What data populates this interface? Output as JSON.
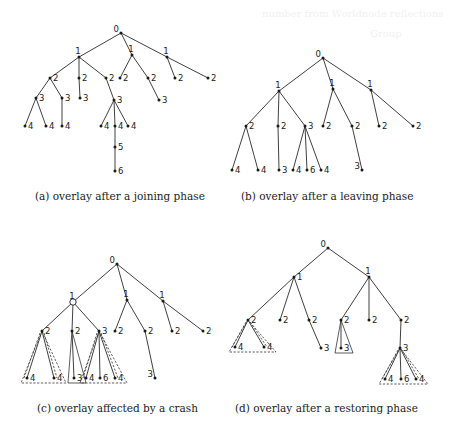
{
  "figure": {
    "ghost_text": [
      "number from Worldnode  reflections",
      "Group"
    ],
    "panels": [
      {
        "id": "a",
        "caption": "(a) overlay after a joining phase",
        "nodes": [
          {
            "id": "r",
            "label": "0",
            "lp": "left"
          },
          {
            "id": "a1",
            "label": "1",
            "lp": "above"
          },
          {
            "id": "a2",
            "label": "1",
            "lp": "above"
          },
          {
            "id": "a3",
            "label": "1",
            "lp": "above"
          },
          {
            "id": "b1",
            "label": "2"
          },
          {
            "id": "b2",
            "label": "2"
          },
          {
            "id": "b3",
            "label": "2"
          },
          {
            "id": "b4",
            "label": "2"
          },
          {
            "id": "b5",
            "label": "2"
          },
          {
            "id": "b6",
            "label": "2"
          },
          {
            "id": "b7",
            "label": "2"
          },
          {
            "id": "c1",
            "label": "3"
          },
          {
            "id": "c2",
            "label": "3"
          },
          {
            "id": "c3",
            "label": "3"
          },
          {
            "id": "c4",
            "label": "3"
          },
          {
            "id": "c5",
            "label": "3"
          },
          {
            "id": "d1",
            "label": "4"
          },
          {
            "id": "d2",
            "label": "4"
          },
          {
            "id": "d3",
            "label": "4"
          },
          {
            "id": "d4",
            "label": "4"
          },
          {
            "id": "d5",
            "label": "4"
          },
          {
            "id": "d6",
            "label": "4"
          },
          {
            "id": "e1",
            "label": "5"
          },
          {
            "id": "f1",
            "label": "6"
          }
        ],
        "edges": [
          [
            "r",
            "a1"
          ],
          [
            "r",
            "a2"
          ],
          [
            "r",
            "a3"
          ],
          [
            "a1",
            "b1"
          ],
          [
            "a1",
            "b2"
          ],
          [
            "a1",
            "b3"
          ],
          [
            "a2",
            "b4"
          ],
          [
            "a2",
            "b5"
          ],
          [
            "a3",
            "b6"
          ],
          [
            "a3",
            "b7"
          ],
          [
            "b1",
            "c1"
          ],
          [
            "b1",
            "c2"
          ],
          [
            "b2",
            "c3"
          ],
          [
            "b3",
            "c4"
          ],
          [
            "b5",
            "c5"
          ],
          [
            "c1",
            "d1"
          ],
          [
            "c1",
            "d2"
          ],
          [
            "c2",
            "d3"
          ],
          [
            "c4",
            "d4"
          ],
          [
            "c4",
            "d5"
          ],
          [
            "c4",
            "d6"
          ],
          [
            "d5",
            "e1"
          ],
          [
            "e1",
            "f1"
          ]
        ],
        "triangles": []
      },
      {
        "id": "b",
        "caption": "(b) overlay after a leaving phase",
        "nodes": [
          {
            "id": "r",
            "label": "0",
            "lp": "left"
          },
          {
            "id": "a1",
            "label": "1",
            "lp": "above"
          },
          {
            "id": "a2",
            "label": "1",
            "lp": "above"
          },
          {
            "id": "a3",
            "label": "1",
            "lp": "above"
          },
          {
            "id": "b1",
            "label": "2"
          },
          {
            "id": "b2",
            "label": "2"
          },
          {
            "id": "b3",
            "label": "3"
          },
          {
            "id": "b4",
            "label": "2"
          },
          {
            "id": "b5",
            "label": "2"
          },
          {
            "id": "b6",
            "label": "2"
          },
          {
            "id": "b7",
            "label": "2"
          },
          {
            "id": "c1",
            "label": "4"
          },
          {
            "id": "c2",
            "label": "4"
          },
          {
            "id": "c3",
            "label": "3"
          },
          {
            "id": "c4",
            "label": "4"
          },
          {
            "id": "c5",
            "label": "6"
          },
          {
            "id": "c6",
            "label": "4"
          },
          {
            "id": "c7",
            "label": "3",
            "lp": "left"
          }
        ],
        "edges": [
          [
            "r",
            "a1"
          ],
          [
            "r",
            "a2"
          ],
          [
            "r",
            "a3"
          ],
          [
            "a1",
            "b1"
          ],
          [
            "a1",
            "b2"
          ],
          [
            "a1",
            "b3"
          ],
          [
            "a2",
            "b4"
          ],
          [
            "a2",
            "b5"
          ],
          [
            "a3",
            "b6"
          ],
          [
            "a3",
            "b7"
          ],
          [
            "b1",
            "c1"
          ],
          [
            "b1",
            "c2"
          ],
          [
            "b2",
            "c3"
          ],
          [
            "b3",
            "c4"
          ],
          [
            "b3",
            "c5"
          ],
          [
            "b3",
            "c6"
          ],
          [
            "b5",
            "c7"
          ]
        ],
        "triangles": []
      },
      {
        "id": "c",
        "caption": "(c) overlay affected by a crash",
        "nodes": [
          {
            "id": "r",
            "label": "0",
            "lp": "left"
          },
          {
            "id": "a1",
            "label": "1",
            "lp": "above",
            "open": true
          },
          {
            "id": "a2",
            "label": "1",
            "lp": "above"
          },
          {
            "id": "a3",
            "label": "1",
            "lp": "above"
          },
          {
            "id": "b1",
            "label": "2"
          },
          {
            "id": "b2",
            "label": "2"
          },
          {
            "id": "b3",
            "label": "3"
          },
          {
            "id": "b4",
            "label": "2"
          },
          {
            "id": "b5",
            "label": "2"
          },
          {
            "id": "b6",
            "label": "2"
          },
          {
            "id": "b7",
            "label": "2"
          },
          {
            "id": "c1",
            "label": "4"
          },
          {
            "id": "c2",
            "label": "4"
          },
          {
            "id": "c3",
            "label": "3"
          },
          {
            "id": "c4",
            "label": "4"
          },
          {
            "id": "c5",
            "label": "6"
          },
          {
            "id": "c6",
            "label": "4"
          },
          {
            "id": "c7",
            "label": "3",
            "lp": "left"
          }
        ],
        "edges": [
          [
            "r",
            "a1"
          ],
          [
            "r",
            "a2"
          ],
          [
            "r",
            "a3"
          ],
          [
            "a1",
            "b1"
          ],
          [
            "a1",
            "b2"
          ],
          [
            "a1",
            "b3"
          ],
          [
            "a2",
            "b4"
          ],
          [
            "a2",
            "b5"
          ],
          [
            "a3",
            "b6"
          ],
          [
            "a3",
            "b7"
          ],
          [
            "b1",
            "c1"
          ],
          [
            "b1",
            "c2"
          ],
          [
            "b2",
            "c3"
          ],
          [
            "b3",
            "c4"
          ],
          [
            "b3",
            "c5"
          ],
          [
            "b3",
            "c6"
          ],
          [
            "b5",
            "c7"
          ]
        ],
        "triangles": [
          {
            "apex": "b1",
            "style": "dashed",
            "span": [
              "c1",
              "c2"
            ]
          },
          {
            "apex": "b2",
            "style": "solid",
            "span": [
              "c3",
              "c3"
            ]
          },
          {
            "apex": "b3",
            "style": "dashed",
            "span": [
              "c4",
              "c6"
            ]
          }
        ]
      },
      {
        "id": "d",
        "caption": "(d) overlay after a restoring phase",
        "nodes": [
          {
            "id": "r",
            "label": "0",
            "lp": "left"
          },
          {
            "id": "a1",
            "label": "1"
          },
          {
            "id": "a2",
            "label": "1",
            "lp": "above"
          },
          {
            "id": "b1",
            "label": "2"
          },
          {
            "id": "b2",
            "label": "2"
          },
          {
            "id": "b3",
            "label": "2"
          },
          {
            "id": "b4",
            "label": "2"
          },
          {
            "id": "b5",
            "label": "2"
          },
          {
            "id": "b6",
            "label": "2"
          },
          {
            "id": "c1",
            "label": "4"
          },
          {
            "id": "c2",
            "label": "4"
          },
          {
            "id": "c3",
            "label": "3"
          },
          {
            "id": "c4",
            "label": "3"
          },
          {
            "id": "c5",
            "label": "3"
          },
          {
            "id": "d1",
            "label": "4"
          },
          {
            "id": "d2",
            "label": "6"
          },
          {
            "id": "d3",
            "label": "4"
          }
        ],
        "edges": [
          [
            "r",
            "a1"
          ],
          [
            "r",
            "a2"
          ],
          [
            "a1",
            "b1"
          ],
          [
            "a1",
            "b2"
          ],
          [
            "a1",
            "b3"
          ],
          [
            "a2",
            "b4"
          ],
          [
            "a2",
            "b5"
          ],
          [
            "a2",
            "b6"
          ],
          [
            "b1",
            "c1"
          ],
          [
            "b1",
            "c2"
          ],
          [
            "b3",
            "c3"
          ],
          [
            "b4",
            "c4"
          ],
          [
            "b6",
            "c5"
          ],
          [
            "c5",
            "d1"
          ],
          [
            "c5",
            "d2"
          ],
          [
            "c5",
            "d3"
          ]
        ],
        "triangles": [
          {
            "apex": "b1",
            "style": "dashed",
            "span": [
              "c1",
              "c2"
            ]
          },
          {
            "apex": "b4",
            "style": "solid",
            "span": [
              "c4",
              "c4"
            ]
          },
          {
            "apex": "c5",
            "style": "dashed",
            "span": [
              "d1",
              "d3"
            ]
          }
        ]
      }
    ]
  }
}
